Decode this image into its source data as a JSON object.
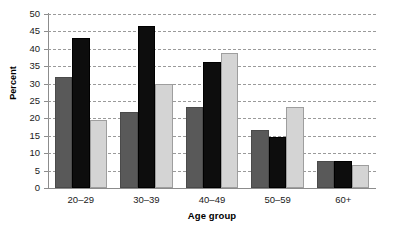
{
  "chart_data": {
    "type": "bar",
    "title": "",
    "subtitle": "",
    "xlabel": "Age group",
    "ylabel": "Percent",
    "categories": [
      "20–29",
      "30–39",
      "40–49",
      "50–59",
      "60+"
    ],
    "series": [
      {
        "name": "series-1",
        "color": "#595959",
        "values": [
          32.0,
          21.8,
          23.3,
          16.8,
          7.9
        ]
      },
      {
        "name": "series-2",
        "color": "#0d0d0d",
        "values": [
          43.0,
          46.5,
          36.2,
          14.6,
          7.8
        ]
      },
      {
        "name": "series-3",
        "color": "#d4d4d4",
        "values": [
          19.5,
          30.0,
          38.7,
          23.2,
          6.6
        ]
      }
    ],
    "ylim": [
      0,
      50
    ],
    "ytick_values": [
      0,
      5,
      10,
      15,
      20,
      25,
      30,
      35,
      40,
      45,
      50
    ],
    "ytick_labels": [
      "0",
      "5",
      "10",
      "15",
      "20",
      "25",
      "30",
      "35",
      "40",
      "45",
      "50"
    ],
    "grid": true,
    "grid_style": "dashed",
    "grid_color": "#9a9a9a",
    "legend": false,
    "legend_position": "none",
    "axis_color": "#8c8c8c",
    "background": "#ffffff"
  }
}
